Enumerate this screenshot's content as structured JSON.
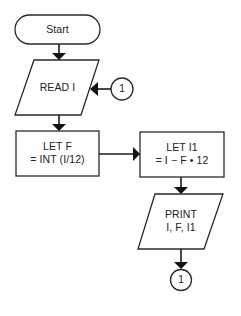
{
  "diagram": {
    "type": "flowchart",
    "colors": {
      "stroke": "#2a2a2a",
      "text": "#222222",
      "background": "#ffffff"
    },
    "nodes": [
      {
        "id": "start",
        "shape": "terminal",
        "lines": [
          "Start"
        ]
      },
      {
        "id": "read",
        "shape": "parallelogram",
        "lines": [
          "READ I"
        ]
      },
      {
        "id": "let_f",
        "shape": "process",
        "lines": [
          "LET F",
          "= INT (I/12)"
        ]
      },
      {
        "id": "let_i1",
        "shape": "process",
        "lines": [
          "LET I1",
          "= I − F • 12"
        ]
      },
      {
        "id": "print",
        "shape": "parallelogram",
        "lines": [
          "PRINT",
          "I, F, I1"
        ]
      },
      {
        "id": "conn_in",
        "shape": "connector",
        "lines": [
          "1"
        ]
      },
      {
        "id": "conn_out",
        "shape": "connector",
        "lines": [
          "1"
        ]
      }
    ],
    "edges": [
      {
        "from": "start",
        "to": "read"
      },
      {
        "from": "conn_in",
        "to": "read"
      },
      {
        "from": "read",
        "to": "let_f"
      },
      {
        "from": "let_f",
        "to": "let_i1"
      },
      {
        "from": "let_i1",
        "to": "print"
      },
      {
        "from": "print",
        "to": "conn_out"
      }
    ]
  }
}
